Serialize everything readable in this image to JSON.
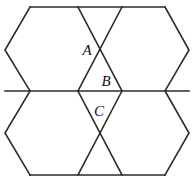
{
  "figure": {
    "kind": "geometry-diagram",
    "background_color": "#ffffff",
    "stroke_color": "#2b2b2b",
    "stroke_width": 1.6,
    "width": 194,
    "height": 182,
    "labels": [
      {
        "id": "A",
        "text": "A",
        "x": 87,
        "y": 55
      },
      {
        "id": "B",
        "text": "B",
        "x": 106,
        "y": 86
      },
      {
        "id": "C",
        "text": "C",
        "x": 99,
        "y": 116
      }
    ],
    "vertices": {
      "x": [
        5,
        30,
        78,
        100,
        122,
        165,
        189
      ],
      "y": [
        7,
        50,
        91,
        133,
        175
      ]
    },
    "hexagons": [
      {
        "name": "top-left-hexagon",
        "points": "30,7 78,7 100,50 78,91 30,91 5,50"
      },
      {
        "name": "top-right-hexagon",
        "points": "122,7 165,7 189,50 165,91 122,91 100,50"
      },
      {
        "name": "bottom-left-hexagon",
        "points": "30,91 78,91 100,133 78,175 30,175 5,133"
      },
      {
        "name": "bottom-right-hexagon",
        "points": "122,91 165,91 189,133 165,175 122,175 100,133"
      }
    ],
    "crossings": [
      {
        "name": "upper-crossing",
        "center_x": 100,
        "center_y": 50,
        "segments": [
          "78,7 122,91",
          "122,7 78,91"
        ]
      },
      {
        "name": "lower-crossing",
        "center_x": 100,
        "center_y": 133,
        "segments": [
          "78,91 122,175",
          "122,91 78,175"
        ]
      }
    ],
    "horizontal_edges": [
      {
        "name": "top-edge",
        "from_x": 30,
        "to_x": 165,
        "y": 7
      },
      {
        "name": "middle-edge",
        "from_x": 5,
        "to_x": 189,
        "y": 91
      },
      {
        "name": "bottom-edge",
        "from_x": 30,
        "to_x": 165,
        "y": 175
      }
    ]
  }
}
